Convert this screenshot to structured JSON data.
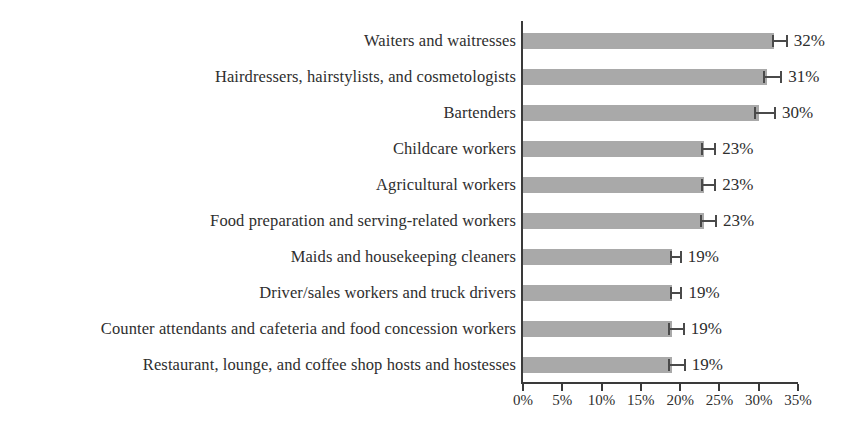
{
  "chart_data": {
    "type": "bar",
    "orientation": "horizontal",
    "title": "",
    "subtitle": "",
    "xlabel": "",
    "ylabel": "",
    "xlim": [
      0,
      35
    ],
    "grid": false,
    "legend": null,
    "categories": [
      "Waiters and waitresses",
      "Hairdressers, hairstylists, and cosmetologists",
      "Bartenders",
      "Childcare workers",
      "Agricultural workers",
      "Food preparation and serving-related workers",
      "Maids and housekeeping cleaners",
      "Driver/sales workers and truck drivers",
      "Counter attendants and cafeteria and food concession workers",
      "Restaurant, lounge, and coffee shop hosts and hostesses"
    ],
    "values": [
      32,
      31,
      30,
      23,
      23,
      23,
      19,
      19,
      19,
      19
    ],
    "value_labels": [
      "32%",
      "31%",
      "30%",
      "23%",
      "23%",
      "23%",
      "19%",
      "19%",
      "19%",
      "19%"
    ],
    "error_low": [
      0.3,
      0.5,
      0.6,
      0.4,
      0.4,
      0.5,
      0.3,
      0.3,
      0.5,
      0.5
    ],
    "error_high": [
      1.7,
      2.0,
      2.2,
      1.6,
      1.6,
      1.7,
      1.2,
      1.3,
      1.6,
      1.7
    ],
    "xticks": [
      0,
      5,
      10,
      15,
      20,
      25,
      30,
      35
    ],
    "xtick_labels": [
      "0%",
      "5%",
      "10%",
      "15%",
      "20%",
      "25%",
      "30%",
      "35%"
    ],
    "colors": {
      "bar": "#a9a9a9",
      "axis": "#3a3a3a",
      "error_bar": "#4a4a4a",
      "text": "#2e2e2e",
      "background": "#ffffff"
    }
  }
}
